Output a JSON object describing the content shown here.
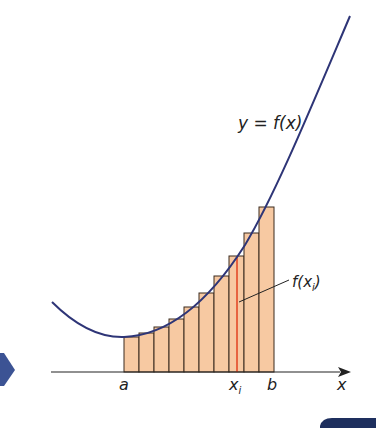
{
  "diagram": {
    "curve_label": "y = f(x)",
    "height_label_base": "f(x",
    "height_label_sub": "i",
    "height_label_close": ")",
    "axis_label_x": "x",
    "tick_a": "a",
    "tick_xi_base": "x",
    "tick_xi_sub": "i",
    "tick_b": "b",
    "rectangle_count": 10,
    "colors": {
      "curve": "#2e3577",
      "rect_fill": "#f7c9a2",
      "rect_stroke": "#3a2a1e",
      "highlight": "#e2401f",
      "axis": "#222222",
      "nav_arrow": "#3c5394",
      "corner_tab": "#1e2f5e"
    }
  }
}
